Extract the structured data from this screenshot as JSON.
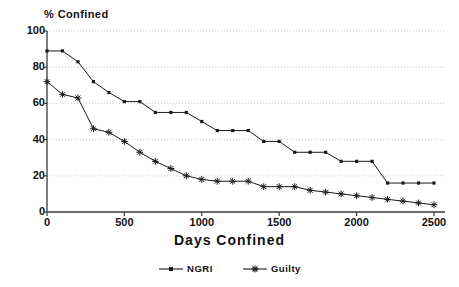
{
  "chart_data": {
    "type": "line",
    "title": "",
    "ylabel": "% Confined",
    "xlabel": "Days Confined",
    "xlim": [
      0,
      2500
    ],
    "ylim": [
      0,
      100
    ],
    "xticks": [
      0,
      500,
      1000,
      1500,
      2000,
      2500
    ],
    "yticks": [
      0,
      20,
      40,
      60,
      80,
      100
    ],
    "grid": true,
    "grid_style": "dotted-horizontal",
    "legend_position": "bottom-center",
    "series": [
      {
        "name": "NGRI",
        "marker": "square-dot",
        "color": "#1a1a1a",
        "x": [
          0,
          100,
          200,
          300,
          400,
          500,
          600,
          700,
          800,
          900,
          1000,
          1100,
          1200,
          1300,
          1400,
          1500,
          1600,
          1700,
          1800,
          1900,
          2000,
          2100,
          2200,
          2300,
          2400,
          2500
        ],
        "y": [
          89,
          89,
          83,
          72,
          66,
          61,
          61,
          55,
          55,
          55,
          50,
          45,
          45,
          45,
          39,
          39,
          33,
          33,
          33,
          28,
          28,
          28,
          16,
          16,
          16,
          16
        ]
      },
      {
        "name": "Guilty",
        "marker": "asterisk",
        "color": "#1a1a1a",
        "x": [
          0,
          100,
          200,
          300,
          400,
          500,
          600,
          700,
          800,
          900,
          1000,
          1100,
          1200,
          1300,
          1400,
          1500,
          1600,
          1700,
          1800,
          1900,
          2000,
          2100,
          2200,
          2300,
          2400,
          2500
        ],
        "y": [
          72,
          65,
          63,
          46,
          44,
          39,
          33,
          28,
          24,
          20,
          18,
          17,
          17,
          17,
          14,
          14,
          14,
          12,
          11,
          10,
          9,
          8,
          7,
          6,
          5,
          4
        ]
      }
    ]
  },
  "axes": {
    "ylabel": "% Confined",
    "xlabel": "Days Confined",
    "ytick_labels": [
      "100",
      "80",
      "60",
      "40",
      "20",
      "0"
    ],
    "xtick_labels": [
      "0",
      "500",
      "1000",
      "1500",
      "2000",
      "2500"
    ]
  },
  "legend": {
    "items": [
      {
        "label": "NGRI",
        "marker": "square-dot"
      },
      {
        "label": "Guilty",
        "marker": "asterisk"
      }
    ]
  }
}
